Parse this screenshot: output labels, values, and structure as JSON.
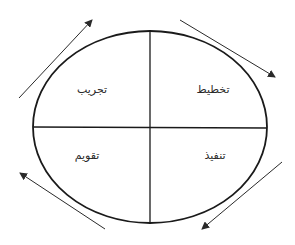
{
  "diagram": {
    "type": "cycle",
    "shape": "ellipse divided into four quadrants",
    "direction": "clockwise",
    "colors": {
      "background": "#ffffff",
      "stroke": "#1a1a1a",
      "arrow": "#2a2a2a",
      "text": "#2a2a2a"
    },
    "quadrants": [
      {
        "position": "top-right",
        "label": "تخطيط",
        "x": 213,
        "y": 89
      },
      {
        "position": "bottom-right",
        "label": "تنفيذ",
        "x": 215,
        "y": 155
      },
      {
        "position": "bottom-left",
        "label": "تقويم",
        "x": 87,
        "y": 155
      },
      {
        "position": "top-left",
        "label": "تجريب",
        "x": 92,
        "y": 89
      }
    ],
    "arrows": [
      {
        "position": "top-right",
        "from": "top-right",
        "to": "right",
        "x1": 180,
        "y1": 20,
        "x2": 275,
        "y2": 77
      },
      {
        "position": "bottom-right",
        "from": "right",
        "to": "bottom",
        "x1": 282,
        "y1": 162,
        "x2": 202,
        "y2": 229
      },
      {
        "position": "bottom-left",
        "from": "bottom",
        "to": "left",
        "x1": 105,
        "y1": 229,
        "x2": 20,
        "y2": 173
      },
      {
        "position": "top-left",
        "from": "left",
        "to": "top",
        "x1": 19,
        "y1": 98,
        "x2": 92,
        "y2": 20
      }
    ]
  }
}
